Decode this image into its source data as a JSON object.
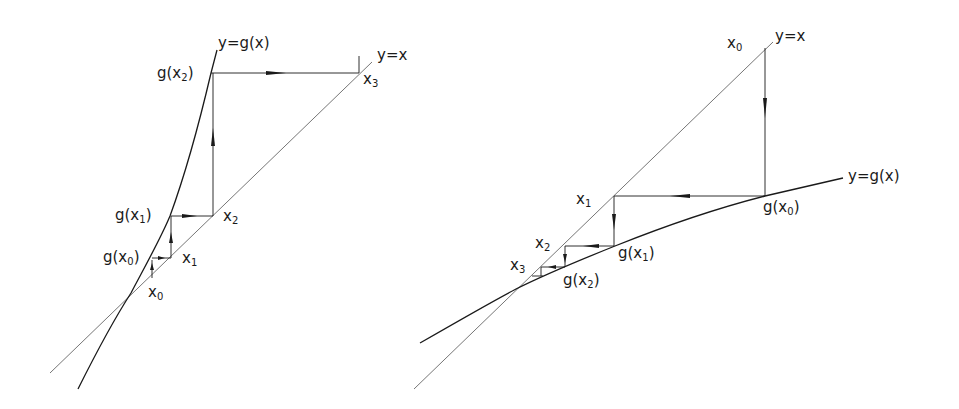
{
  "figure": {
    "line_color": "#1a1a1a",
    "identity_line_color": "#555555",
    "background": "#ffffff"
  },
  "left_panel": {
    "case": "divergent",
    "curve_label": "y=g(x)",
    "identity_label": "y=x",
    "labels": [
      {
        "id": "g_x2",
        "base": "g(x",
        "sub": "2",
        "tail": ")"
      },
      {
        "id": "g_x1",
        "base": "g(x",
        "sub": "1",
        "tail": ")"
      },
      {
        "id": "g_x0",
        "base": "g(x",
        "sub": "0",
        "tail": ")"
      },
      {
        "id": "x0",
        "base": "x",
        "sub": "0",
        "tail": ""
      },
      {
        "id": "x1",
        "base": "x",
        "sub": "1",
        "tail": ""
      },
      {
        "id": "x2",
        "base": "x",
        "sub": "2",
        "tail": ""
      },
      {
        "id": "x3",
        "base": "x",
        "sub": "3",
        "tail": ""
      }
    ],
    "iteration_path": [
      {
        "from": "x0",
        "to": "g(x0)",
        "direction": "up"
      },
      {
        "from": "g(x0)",
        "to": "x1",
        "direction": "right"
      },
      {
        "from": "x1",
        "to": "g(x1)",
        "direction": "up"
      },
      {
        "from": "g(x1)",
        "to": "x2",
        "direction": "right"
      },
      {
        "from": "x2",
        "to": "g(x2)",
        "direction": "up"
      },
      {
        "from": "g(x2)",
        "to": "x3",
        "direction": "right"
      }
    ]
  },
  "right_panel": {
    "case": "convergent",
    "curve_label": "y=g(x)",
    "identity_label": "y=x",
    "labels": [
      {
        "id": "x0",
        "base": "x",
        "sub": "0",
        "tail": ""
      },
      {
        "id": "x1",
        "base": "x",
        "sub": "1",
        "tail": ""
      },
      {
        "id": "x2",
        "base": "x",
        "sub": "2",
        "tail": ""
      },
      {
        "id": "x3",
        "base": "x",
        "sub": "3",
        "tail": ""
      },
      {
        "id": "g_x0",
        "base": "g(x",
        "sub": "0",
        "tail": ")"
      },
      {
        "id": "g_x1",
        "base": "g(x",
        "sub": "1",
        "tail": ")"
      },
      {
        "id": "g_x2",
        "base": "g(x",
        "sub": "2",
        "tail": ")"
      }
    ],
    "iteration_path": [
      {
        "from": "x0",
        "to": "g(x0)",
        "direction": "down"
      },
      {
        "from": "g(x0)",
        "to": "x1",
        "direction": "left"
      },
      {
        "from": "x1",
        "to": "g(x1)",
        "direction": "down"
      },
      {
        "from": "g(x1)",
        "to": "x2",
        "direction": "left"
      },
      {
        "from": "x2",
        "to": "g(x2)",
        "direction": "down"
      },
      {
        "from": "g(x2)",
        "to": "x3",
        "direction": "left"
      }
    ]
  }
}
